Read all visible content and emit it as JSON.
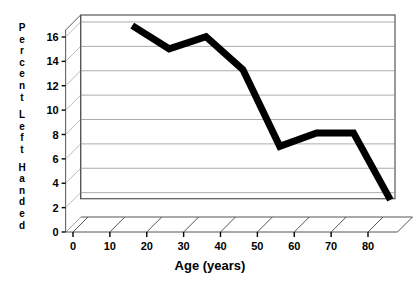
{
  "chart_data": {
    "type": "line",
    "title": "",
    "subtitle": "",
    "xlabel": "Age (years)",
    "ylabel": "Percent Left Handed",
    "ylabel_letters": [
      "P",
      "e",
      "r",
      "c",
      "e",
      "n",
      "t",
      "L",
      "e",
      "f",
      "t",
      "H",
      "a",
      "n",
      "d",
      "e",
      "d"
    ],
    "ylabel_words": [
      "Percent",
      "Left",
      "Handed"
    ],
    "x": [
      12,
      22,
      32,
      42,
      52,
      62,
      72,
      82
    ],
    "values": [
      15.7,
      13.8,
      14.8,
      12.1,
      5.8,
      6.9,
      6.9,
      1.4
    ],
    "series": [
      {
        "name": "Percent Left Handed",
        "values": [
          15.7,
          13.8,
          14.8,
          12.1,
          5.8,
          6.9,
          6.9,
          1.4
        ],
        "color": "#000000"
      }
    ],
    "xlim": [
      -2,
      88
    ],
    "ylim": [
      0,
      17
    ],
    "xticks": [
      0,
      10,
      20,
      30,
      40,
      50,
      60,
      70,
      80
    ],
    "xtick_labels": [
      "0",
      "10",
      "20",
      "30",
      "40",
      "50",
      "60",
      "70",
      "80"
    ],
    "yticks": [
      0,
      2,
      4,
      6,
      8,
      10,
      12,
      14,
      16
    ],
    "ytick_labels": [
      "0",
      "2",
      "4",
      "6",
      "8",
      "10",
      "12",
      "14",
      "16"
    ],
    "grid": true,
    "grid_axis": "y",
    "grid_color": "#888888",
    "legend": false,
    "legend_position": "none",
    "style": "3d-floor-backwall",
    "line_color": "#000000",
    "line_width": 7,
    "axis_color": "#555555",
    "background": "#ffffff",
    "annotations": []
  }
}
